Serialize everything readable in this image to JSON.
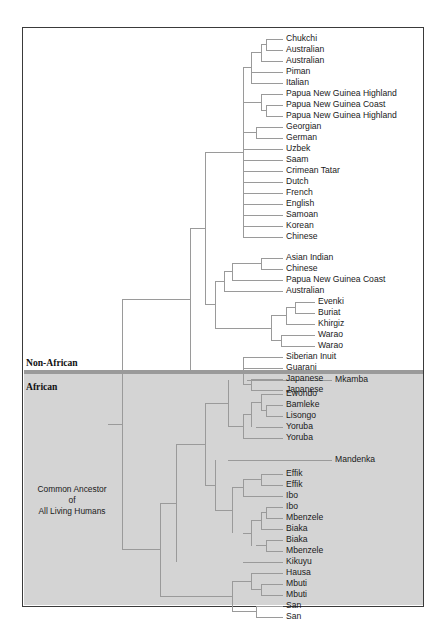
{
  "figure": {
    "type": "phylogenetic-tree",
    "orientation": "left-to-right-rectangular-cladogram",
    "frame": {
      "x": 22,
      "y": 27,
      "width": 402,
      "height": 580,
      "border_color": "#3a3a3a",
      "background": "#ffffff"
    },
    "shaded_region": {
      "label": "African",
      "fill": "#d4d4d4",
      "divider_color": "#9a9a9a",
      "top_y": 373,
      "bottom_y": 605
    },
    "branch_color": "#9a9a9a",
    "text_color": "#1a1a1a"
  },
  "group_labels": [
    {
      "name": "non-african-label",
      "text": "Non-African",
      "x": 26,
      "y": 364
    },
    {
      "name": "african-label",
      "text": "African",
      "x": 26,
      "y": 388
    }
  ],
  "ancestor_label": {
    "line1": "Common Ancestor",
    "line2": "of",
    "line3": "All Living Humans",
    "x": 72,
    "y": 501
  },
  "tips": [
    {
      "label": "Chukchi",
      "y": 39,
      "x": 286,
      "group": "non-african"
    },
    {
      "label": "Australian",
      "y": 50,
      "x": 286,
      "group": "non-african"
    },
    {
      "label": "Australian",
      "y": 61,
      "x": 286,
      "group": "non-african"
    },
    {
      "label": "Piman",
      "y": 72,
      "x": 286,
      "group": "non-african"
    },
    {
      "label": "Italian",
      "y": 83,
      "x": 286,
      "group": "non-african"
    },
    {
      "label": "Papua New Guinea Highland",
      "y": 94,
      "x": 286,
      "group": "non-african"
    },
    {
      "label": "Papua New Guinea Coast",
      "y": 105,
      "x": 286,
      "group": "non-african"
    },
    {
      "label": "Papua New Guinea Highland",
      "y": 116,
      "x": 286,
      "group": "non-african"
    },
    {
      "label": "Georgian",
      "y": 127,
      "x": 286,
      "group": "non-african"
    },
    {
      "label": "German",
      "y": 138,
      "x": 286,
      "group": "non-african"
    },
    {
      "label": "Uzbek",
      "y": 149,
      "x": 286,
      "group": "non-african"
    },
    {
      "label": "Saam",
      "y": 160,
      "x": 286,
      "group": "non-african"
    },
    {
      "label": "Crimean Tatar",
      "y": 171,
      "x": 286,
      "group": "non-african"
    },
    {
      "label": "Dutch",
      "y": 182,
      "x": 286,
      "group": "non-african"
    },
    {
      "label": "French",
      "y": 193,
      "x": 286,
      "group": "non-african"
    },
    {
      "label": "English",
      "y": 204,
      "x": 286,
      "group": "non-african"
    },
    {
      "label": "Samoan",
      "y": 215,
      "x": 286,
      "group": "non-african"
    },
    {
      "label": "Korean",
      "y": 226,
      "x": 286,
      "group": "non-african"
    },
    {
      "label": "Chinese",
      "y": 237,
      "x": 286,
      "group": "non-african"
    },
    {
      "label": "Asian Indian",
      "y": 258,
      "x": 286,
      "group": "non-african"
    },
    {
      "label": "Chinese",
      "y": 269,
      "x": 286,
      "group": "non-african"
    },
    {
      "label": "Papua New Guinea Coast",
      "y": 280,
      "x": 286,
      "group": "non-african"
    },
    {
      "label": "Papua New Guinea Coast 2",
      "y": 280,
      "x": 286,
      "group": "hidden"
    },
    {
      "label": "Australian",
      "y": 291,
      "x": 286,
      "group": "non-african"
    },
    {
      "label": "Evenki",
      "y": 302,
      "x": 318,
      "group": "non-african"
    },
    {
      "label": "Buriat",
      "y": 313,
      "x": 318,
      "group": "non-african"
    },
    {
      "label": "Khirgiz",
      "y": 324,
      "x": 318,
      "group": "non-african"
    },
    {
      "label": "Warao",
      "y": 335,
      "x": 318,
      "group": "non-african"
    },
    {
      "label": "Warao",
      "y": 346,
      "x": 318,
      "group": "non-african"
    },
    {
      "label": "Siberian Inuit",
      "y": 357,
      "x": 286,
      "group": "non-african"
    },
    {
      "label": "Guarani",
      "y": 368,
      "x": 286,
      "group": "non-african"
    },
    {
      "label": "Japanese",
      "y": 379,
      "x": 286,
      "group": "non-african"
    },
    {
      "label": "Japanese",
      "y": 390,
      "x": 286,
      "group": "non-african"
    },
    {
      "label": "Mkamba",
      "y": 380,
      "x": 335,
      "group": "african"
    },
    {
      "label": "Ewondo",
      "y": 394,
      "x": 286,
      "group": "african"
    },
    {
      "label": "Bamleke",
      "y": 405,
      "x": 286,
      "group": "african"
    },
    {
      "label": "Lisongo",
      "y": 416,
      "x": 286,
      "group": "african"
    },
    {
      "label": "Yoruba",
      "y": 427,
      "x": 286,
      "group": "african"
    },
    {
      "label": "Yoruba",
      "y": 438,
      "x": 286,
      "group": "african"
    },
    {
      "label": "Mandenka",
      "y": 460,
      "x": 335,
      "group": "african"
    },
    {
      "label": "Effik",
      "y": 474,
      "x": 286,
      "group": "african"
    },
    {
      "label": "Effik",
      "y": 485,
      "x": 286,
      "group": "african"
    },
    {
      "label": "Ibo",
      "y": 496,
      "x": 286,
      "group": "african"
    },
    {
      "label": "Ibo",
      "y": 507,
      "x": 286,
      "group": "african"
    },
    {
      "label": "Mbenzele",
      "y": 518,
      "x": 286,
      "group": "african"
    },
    {
      "label": "Biaka",
      "y": 529,
      "x": 286,
      "group": "african"
    },
    {
      "label": "Biaka",
      "y": 540,
      "x": 286,
      "group": "african"
    },
    {
      "label": "Mbenzele",
      "y": 551,
      "x": 286,
      "group": "african"
    },
    {
      "label": "Kikuyu",
      "y": 562,
      "x": 286,
      "group": "african"
    },
    {
      "label": "Hausa",
      "y": 573,
      "x": 286,
      "group": "african"
    },
    {
      "label": "Mbuti",
      "y": 584,
      "x": 286,
      "group": "african"
    },
    {
      "label": "Mbuti",
      "y": 595,
      "x": 286,
      "group": "african"
    },
    {
      "label": "San",
      "y": 606,
      "x": 286,
      "group": "african"
    },
    {
      "label": "San",
      "y": 617,
      "x": 286,
      "group": "african"
    }
  ],
  "branch_segments": [
    [
      266,
      39,
      283,
      39
    ],
    [
      266,
      50,
      283,
      50
    ],
    [
      261,
      61,
      283,
      61
    ],
    [
      266,
      39,
      266,
      50
    ],
    [
      261,
      44.5,
      266,
      44.5
    ],
    [
      261,
      44.5,
      261,
      61
    ],
    [
      251,
      52.8,
      261,
      52.8
    ],
    [
      251,
      72,
      283,
      72
    ],
    [
      251,
      83,
      283,
      83
    ],
    [
      251,
      52.8,
      251,
      83
    ],
    [
      243,
      67.9,
      251,
      67.9
    ],
    [
      261,
      94,
      283,
      94
    ],
    [
      266,
      105,
      283,
      105
    ],
    [
      266,
      116,
      283,
      116
    ],
    [
      266,
      105,
      266,
      116
    ],
    [
      261,
      110.5,
      266,
      110.5
    ],
    [
      261,
      94,
      261,
      110.5
    ],
    [
      251,
      102.2,
      261,
      102.2
    ],
    [
      243,
      102.2,
      251,
      102.2
    ],
    [
      256,
      127,
      283,
      127
    ],
    [
      256,
      138,
      283,
      138
    ],
    [
      256,
      127,
      256,
      138
    ],
    [
      243,
      132.5,
      256,
      132.5
    ],
    [
      243,
      149,
      283,
      149
    ],
    [
      243,
      160,
      283,
      160
    ],
    [
      243,
      171,
      283,
      171
    ],
    [
      243,
      182,
      283,
      182
    ],
    [
      243,
      193,
      283,
      193
    ],
    [
      243,
      204,
      283,
      204
    ],
    [
      243,
      215,
      283,
      215
    ],
    [
      243,
      226,
      283,
      226
    ],
    [
      243,
      237,
      283,
      237
    ],
    [
      243,
      67.9,
      243,
      237
    ],
    [
      205,
      152,
      243,
      152
    ],
    [
      261,
      258,
      283,
      258
    ],
    [
      261,
      269,
      283,
      269
    ],
    [
      261,
      258,
      261,
      269
    ],
    [
      251,
      263.5,
      261,
      263.5
    ],
    [
      232,
      263.5,
      251,
      263.5
    ],
    [
      232,
      280,
      283,
      280
    ],
    [
      232,
      263.5,
      232,
      280
    ],
    [
      224,
      271.8,
      232,
      271.8
    ],
    [
      224,
      291,
      283,
      291
    ],
    [
      224,
      271.8,
      224,
      291
    ],
    [
      215,
      281.4,
      224,
      281.4
    ],
    [
      295,
      302,
      315,
      302
    ],
    [
      295,
      313,
      315,
      313
    ],
    [
      295,
      302,
      295,
      313
    ],
    [
      286,
      307.5,
      295,
      307.5
    ],
    [
      286,
      324,
      315,
      324
    ],
    [
      286,
      307.5,
      286,
      324
    ],
    [
      271,
      315.8,
      286,
      315.8
    ],
    [
      281,
      335,
      315,
      335
    ],
    [
      281,
      346,
      315,
      346
    ],
    [
      281,
      335,
      281,
      346
    ],
    [
      271,
      340.5,
      281,
      340.5
    ],
    [
      271,
      315.8,
      271,
      340.5
    ],
    [
      247,
      328.2,
      271,
      328.2
    ],
    [
      247,
      328.2,
      247,
      328.2
    ],
    [
      215,
      328.2,
      247,
      328.2
    ],
    [
      215,
      281.4,
      215,
      328.2
    ],
    [
      205,
      304.8,
      215,
      304.8
    ],
    [
      205,
      152,
      205,
      304.8
    ],
    [
      190,
      228.4,
      205,
      228.4
    ],
    [
      243,
      357,
      283,
      357
    ],
    [
      243,
      368,
      283,
      368
    ],
    [
      251,
      379,
      283,
      379
    ],
    [
      251,
      390,
      283,
      390
    ],
    [
      251,
      379,
      251,
      390
    ],
    [
      243,
      384.5,
      251,
      384.5
    ],
    [
      243,
      357,
      243,
      384.5
    ],
    [
      226,
      370.8,
      243,
      370.8
    ],
    [
      226,
      370.8,
      226,
      370.8
    ],
    [
      190,
      370.8,
      226,
      370.8
    ],
    [
      190,
      228.4,
      190,
      370.8
    ],
    [
      122,
      299.6,
      190,
      299.6
    ],
    [
      247,
      380,
      332,
      380
    ],
    [
      261,
      394,
      283,
      394
    ],
    [
      266,
      405,
      283,
      405
    ],
    [
      266,
      416,
      283,
      416
    ],
    [
      266,
      405,
      266,
      416
    ],
    [
      261,
      410.5,
      266,
      410.5
    ],
    [
      261,
      394,
      261,
      410.5
    ],
    [
      251,
      402.2,
      261,
      402.2
    ],
    [
      256,
      427,
      283,
      427
    ],
    [
      251,
      402.2,
      251,
      427
    ],
    [
      243,
      414.6,
      251,
      414.6
    ],
    [
      243,
      438,
      283,
      438
    ],
    [
      243,
      414.6,
      243,
      438
    ],
    [
      228,
      426.3,
      243,
      426.3
    ],
    [
      228,
      380,
      228,
      426.3
    ],
    [
      205,
      403,
      228,
      403
    ],
    [
      228,
      460,
      332,
      460
    ],
    [
      261,
      474,
      283,
      474
    ],
    [
      261,
      485,
      283,
      485
    ],
    [
      261,
      474,
      261,
      485
    ],
    [
      251,
      479.5,
      261,
      479.5
    ],
    [
      243,
      479.5,
      251,
      479.5
    ],
    [
      243,
      496,
      283,
      496
    ],
    [
      243,
      479.5,
      243,
      496
    ],
    [
      232,
      487.8,
      243,
      487.8
    ],
    [
      266,
      507,
      283,
      507
    ],
    [
      266,
      518,
      283,
      518
    ],
    [
      266,
      507,
      266,
      518
    ],
    [
      261,
      512.5,
      266,
      512.5
    ],
    [
      261,
      529,
      283,
      529
    ],
    [
      261,
      512.5,
      261,
      529
    ],
    [
      251,
      520.8,
      261,
      520.8
    ],
    [
      266,
      540,
      283,
      540
    ],
    [
      266,
      551,
      283,
      551
    ],
    [
      266,
      540,
      266,
      551
    ],
    [
      256,
      545.5,
      266,
      545.5
    ],
    [
      251,
      520.8,
      251,
      545.5
    ],
    [
      243,
      533.2,
      251,
      533.2
    ],
    [
      232,
      487.8,
      232,
      533.2
    ],
    [
      215,
      510.5,
      232,
      510.5
    ],
    [
      215,
      460,
      215,
      510.5
    ],
    [
      205,
      485,
      215,
      485
    ],
    [
      205,
      403,
      205,
      485
    ],
    [
      176,
      444,
      205,
      444
    ],
    [
      243,
      562,
      283,
      562
    ],
    [
      176,
      444,
      176,
      562
    ],
    [
      160,
      503,
      176,
      503
    ],
    [
      251,
      573,
      283,
      573
    ],
    [
      261,
      584,
      283,
      584
    ],
    [
      261,
      595,
      283,
      595
    ],
    [
      261,
      584,
      261,
      595
    ],
    [
      251,
      589.5,
      261,
      589.5
    ],
    [
      251,
      573,
      251,
      589.5
    ],
    [
      232,
      581.2,
      251,
      581.2
    ],
    [
      256,
      606,
      283,
      606
    ],
    [
      256,
      617,
      283,
      617
    ],
    [
      256,
      606,
      256,
      617
    ],
    [
      232,
      611.5,
      256,
      611.5
    ],
    [
      232,
      581.2,
      232,
      611.5
    ],
    [
      205,
      596.4,
      232,
      596.4
    ],
    [
      160,
      596.4,
      205,
      596.4
    ],
    [
      160,
      503,
      160,
      596.4
    ],
    [
      122,
      549.7,
      160,
      549.7
    ],
    [
      122,
      299.6,
      122,
      549.7
    ],
    [
      108,
      424.6,
      122,
      424.6
    ]
  ]
}
